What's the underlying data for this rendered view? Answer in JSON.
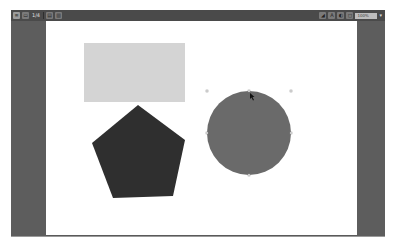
{
  "toolbar": {
    "left": [
      {
        "icon": "menu-icon",
        "glyph": "≡"
      },
      {
        "icon": "sidebar-icon",
        "glyph": "▭"
      },
      {
        "page_indicator": "1/4"
      },
      {
        "icon": "grid-view-icon",
        "glyph": "▤"
      },
      {
        "icon": "layout-icon",
        "glyph": "▥"
      }
    ],
    "right": [
      {
        "icon": "shape-tool-icon",
        "glyph": "◢"
      },
      {
        "icon": "text-tool-icon",
        "glyph": "A"
      },
      {
        "icon": "color-icon",
        "glyph": "◐"
      },
      {
        "icon": "frame-icon",
        "glyph": "◻"
      }
    ],
    "zoom_value": "100%",
    "zoom_caret": "▾"
  },
  "canvas": {
    "background": "#ffffff",
    "shapes": [
      {
        "type": "rectangle",
        "name": "light-rectangle",
        "fill": "#d4d4d4",
        "x": 38,
        "y": 22,
        "width": 101,
        "height": 59
      },
      {
        "type": "pentagon",
        "name": "dark-pentagon",
        "fill": "#2f2f2f",
        "points": "92,84 139,119 127,175 67,177 46,122"
      },
      {
        "type": "circle",
        "name": "gray-circle",
        "fill": "#6a6a6a",
        "cx": 203,
        "cy": 112,
        "r": 42,
        "selected": true
      }
    ]
  },
  "colors": {
    "toolbar_bg": "#4a4a4a",
    "margin_bg": "#5d5d5d",
    "canvas_bg": "#ffffff"
  }
}
